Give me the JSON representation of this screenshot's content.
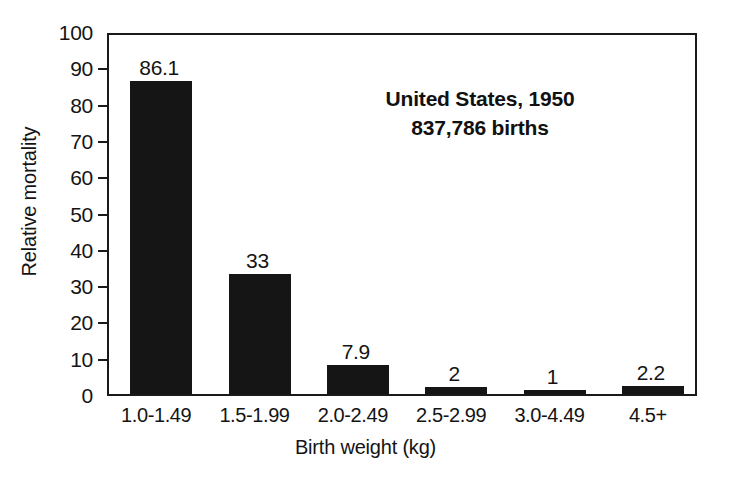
{
  "chart_data": {
    "type": "bar",
    "title": "",
    "categories": [
      "1.0-1.49",
      "1.5-1.99",
      "2.0-2.49",
      "2.5-2.99",
      "3.0-4.49",
      "4.5+"
    ],
    "values": [
      86.1,
      33,
      7.9,
      2,
      1,
      2.2
    ],
    "value_labels": [
      "86.1",
      "33",
      "7.9",
      "2",
      "1",
      "2.2"
    ],
    "xlabel": "Birth weight (kg)",
    "ylabel": "Relative mortality",
    "ylim": [
      0,
      100
    ],
    "ytick_labels": [
      "0",
      "10",
      "20",
      "30",
      "40",
      "50",
      "60",
      "70",
      "80",
      "90",
      "100"
    ],
    "ytick_values": [
      0,
      10,
      20,
      30,
      40,
      50,
      60,
      70,
      80,
      90,
      100
    ],
    "grid": false,
    "legend": null,
    "bar_color": "#151515",
    "axis_color": "#1a1a1a",
    "background_color": "#ffffff",
    "annotations": [
      {
        "line1": "United States, 1950",
        "line2": "837,786 births"
      }
    ]
  },
  "annotation": {
    "line1": "United States, 1950",
    "line2": "837,786 births"
  },
  "axes": {
    "x_title": "Birth weight (kg)",
    "y_title": "Relative mortality"
  }
}
